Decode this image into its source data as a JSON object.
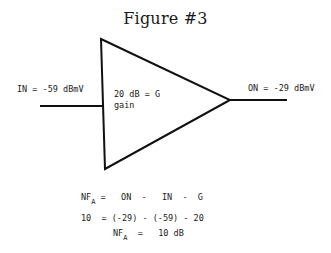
{
  "figure": {
    "title": "Figure #3",
    "input_label": "IN = -59 dBmV",
    "output_label": "ON = -29 dBmV",
    "gain_label_line1": "20 dB = G",
    "gain_label_line2": "gain"
  },
  "equations": {
    "line1": {
      "lhs": "NF",
      "lhs_sub": "A",
      "rhs": "=   ON  -   IN  -  G"
    },
    "line2": {
      "text": "10  = (-29) - (-59) - 20"
    },
    "line3": {
      "lhs": "NF",
      "lhs_sub": "A",
      "rhs": "=   10 dB"
    }
  }
}
